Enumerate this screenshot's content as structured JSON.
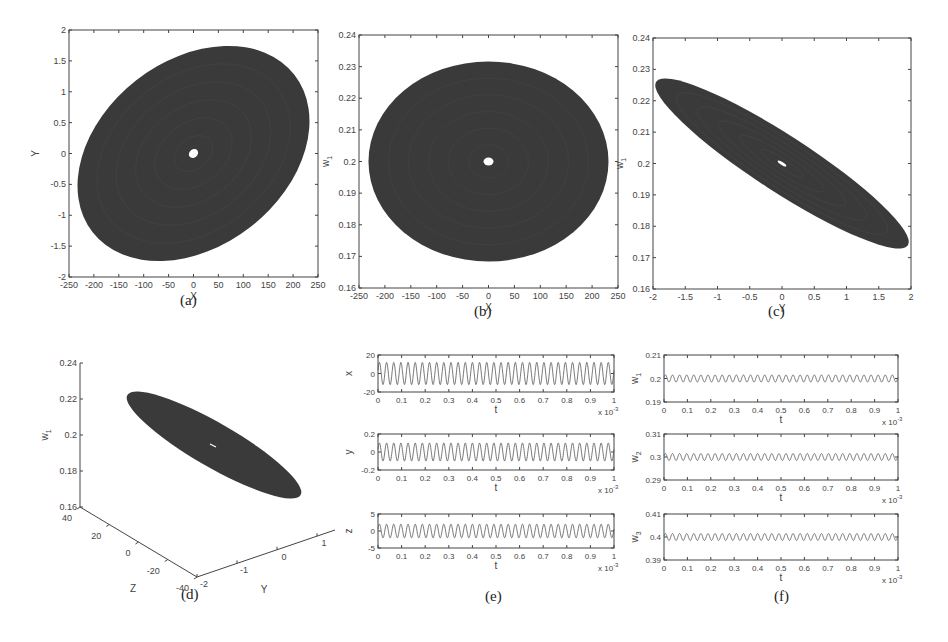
{
  "figure": {
    "captions": [
      "(a)",
      "(b)",
      "(c)",
      "(d)",
      "(e)",
      "(f)"
    ]
  },
  "chart_data": [
    {
      "id": "a",
      "type": "scatter",
      "title": "",
      "subtitle": "Phase portrait X-Y",
      "xlabel": "X",
      "ylabel": "Y",
      "xlim": [
        -250,
        250
      ],
      "ylim": [
        -2,
        2
      ],
      "xticks": [
        -250,
        -200,
        -150,
        -100,
        -50,
        0,
        50,
        100,
        150,
        200,
        250
      ],
      "yticks": [
        -2,
        -1.5,
        -1,
        -0.5,
        0,
        0.5,
        1,
        1.5,
        2
      ],
      "grid": false,
      "shape": {
        "kind": "filled-ellipse",
        "center": [
          0,
          0
        ],
        "x_extent": [
          -240,
          245
        ],
        "y_extent": [
          -1.9,
          1.88
        ],
        "tilt": "positive",
        "hole_center": [
          0,
          0
        ]
      }
    },
    {
      "id": "b",
      "type": "scatter",
      "subtitle": "Phase portrait X-w1",
      "xlabel": "X",
      "ylabel": "w1",
      "xlim": [
        -250,
        250
      ],
      "ylim": [
        0.16,
        0.24
      ],
      "xticks": [
        -250,
        -200,
        -150,
        -100,
        -50,
        0,
        50,
        100,
        150,
        200,
        250
      ],
      "yticks": [
        0.16,
        0.17,
        0.18,
        0.19,
        0.2,
        0.21,
        0.22,
        0.23,
        0.24
      ],
      "grid": false,
      "shape": {
        "kind": "filled-ellipse",
        "center": [
          0,
          0.2
        ],
        "x_extent": [
          -240,
          240
        ],
        "y_extent": [
          0.169,
          0.232
        ],
        "tilt": "none",
        "hole_center": [
          0,
          0.2
        ]
      }
    },
    {
      "id": "c",
      "type": "scatter",
      "subtitle": "Phase portrait Y-w1",
      "xlabel": "Y",
      "ylabel": "w1",
      "xlim": [
        -2,
        2
      ],
      "ylim": [
        0.16,
        0.24
      ],
      "xticks": [
        -2,
        -1.5,
        -1,
        -0.5,
        0,
        0.5,
        1,
        1.5,
        2
      ],
      "yticks": [
        0.16,
        0.17,
        0.18,
        0.19,
        0.2,
        0.21,
        0.22,
        0.23,
        0.24
      ],
      "grid": false,
      "shape": {
        "kind": "filled-ellipse",
        "center": [
          0,
          0.2
        ],
        "x_extent": [
          -1.9,
          1.9
        ],
        "y_extent": [
          0.169,
          0.232
        ],
        "tilt": "negative",
        "hole_center": [
          0,
          0.2
        ]
      }
    },
    {
      "id": "d",
      "type": "scatter",
      "subtitle": "3D phase portrait Y-Z-w1",
      "xlabel": "Y",
      "ylabel": "Z",
      "zlabel": "w1",
      "ylim": [
        -40,
        40
      ],
      "xlim": [
        -2,
        2
      ],
      "zlim": [
        0.16,
        0.24
      ],
      "zticks": [
        0.16,
        0.18,
        0.2,
        0.22,
        0.24
      ],
      "zticks_labels": [
        "0.16",
        "0.18",
        "0.2",
        "0.22",
        "0.24"
      ],
      "yticks": [
        -40,
        -20,
        0,
        20,
        40
      ],
      "xticks": [
        -2,
        -1,
        0,
        1
      ],
      "grid": false
    },
    {
      "id": "e",
      "type": "line",
      "subtitle": "Time series x, y, z",
      "series": [
        {
          "name": "x",
          "ylabel": "x",
          "ylim": [
            -20,
            20
          ],
          "yticks": [
            -20,
            0,
            20
          ],
          "amplitude": 12,
          "offset": 0,
          "cycles": 33
        },
        {
          "name": "y",
          "ylabel": "y",
          "ylim": [
            -0.2,
            0.2
          ],
          "yticks": [
            -0.2,
            0,
            0.2
          ],
          "amplitude": 0.1,
          "offset": 0,
          "cycles": 33
        },
        {
          "name": "z",
          "ylabel": "z",
          "ylim": [
            -5,
            5
          ],
          "yticks": [
            -5,
            0,
            5
          ],
          "amplitude": 2,
          "offset": 0,
          "cycles": 33
        }
      ],
      "xlabel": "t",
      "xlim": [
        0,
        1
      ],
      "xticks": [
        0,
        0.1,
        0.2,
        0.3,
        0.4,
        0.5,
        0.6,
        0.7,
        0.8,
        0.9,
        1
      ],
      "x_multiplier": "x 10^-3"
    },
    {
      "id": "f",
      "type": "line",
      "subtitle": "Time series w1, w2, w3",
      "series": [
        {
          "name": "w1",
          "ylabel": "w1",
          "ylim": [
            0.19,
            0.21
          ],
          "yticks": [
            0.19,
            0.2,
            0.21
          ],
          "amplitude": 0.0015,
          "offset": 0.2,
          "cycles": 33
        },
        {
          "name": "w2",
          "ylabel": "w2",
          "ylim": [
            0.29,
            0.31
          ],
          "yticks": [
            0.29,
            0.3,
            0.31
          ],
          "amplitude": 0.0015,
          "offset": 0.3,
          "cycles": 33
        },
        {
          "name": "w3",
          "ylabel": "w3",
          "ylim": [
            0.39,
            0.41
          ],
          "yticks": [
            0.39,
            0.4,
            0.41
          ],
          "amplitude": 0.0015,
          "offset": 0.4,
          "cycles": 33
        }
      ],
      "xlabel": "t",
      "xlim": [
        0,
        1
      ],
      "xticks": [
        0,
        0.1,
        0.2,
        0.3,
        0.4,
        0.5,
        0.6,
        0.7,
        0.8,
        0.9,
        1
      ],
      "x_multiplier": "x 10^-3"
    }
  ],
  "layout": {
    "a": {
      "left": 69,
      "top": 30,
      "right": 318,
      "bottom": 277,
      "caption_x": 189,
      "caption_y": 304
    },
    "b": {
      "left": 359,
      "top": 35,
      "right": 618,
      "bottom": 288,
      "caption_x": 482,
      "caption_y": 315
    },
    "c": {
      "left": 653,
      "top": 38,
      "right": 911,
      "bottom": 289,
      "caption_x": 776,
      "caption_y": 315
    },
    "d": {
      "caption_x": 190,
      "caption_y": 598
    },
    "e": {
      "left": 378,
      "right": 614,
      "rows": [
        [
          355,
          392
        ],
        [
          434,
          470
        ],
        [
          514,
          548
        ]
      ],
      "caption_x": 494,
      "caption_y": 600
    },
    "f": {
      "left": 664,
      "right": 898,
      "rows": [
        [
          355,
          402
        ],
        [
          434,
          480
        ],
        [
          514,
          560
        ]
      ],
      "caption_x": 782,
      "caption_y": 600
    }
  },
  "colors": {
    "fill": "#3a3a3a",
    "line": "#555555",
    "axis": "#444444"
  }
}
